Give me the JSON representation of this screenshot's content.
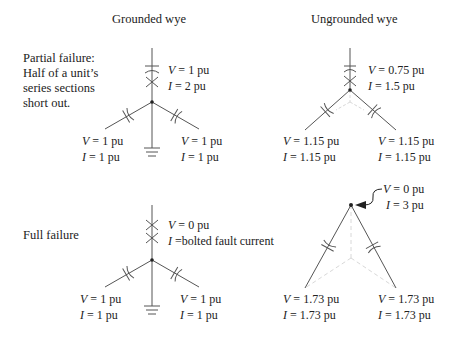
{
  "columns": {
    "left": "Grounded wye",
    "right": "Ungrounded wye"
  },
  "rows": {
    "partial": {
      "label_lines": [
        "Partial failure:",
        "Half of a unit’s",
        "series sections",
        "short out."
      ],
      "grounded": {
        "top": {
          "V": "1 pu",
          "I": "2 pu"
        },
        "left": {
          "V": "1 pu",
          "I": "1 pu"
        },
        "right": {
          "V": "1 pu",
          "I": "1 pu"
        }
      },
      "ungrounded": {
        "top": {
          "V": "0.75 pu",
          "I": "1.5 pu"
        },
        "left": {
          "V": "1.15 pu",
          "I": "1.15 pu"
        },
        "right": {
          "V": "1.15 pu",
          "I": "1.15 pu"
        }
      }
    },
    "full": {
      "label_lines": [
        "Full failure"
      ],
      "grounded": {
        "top": {
          "V": "0 pu",
          "I": "bolted fault current"
        },
        "left": {
          "V": "1 pu",
          "I": "1 pu"
        },
        "right": {
          "V": "1 pu",
          "I": "1 pu"
        }
      },
      "ungrounded": {
        "apex": {
          "V": "0 pu",
          "I": "3 pu"
        },
        "left": {
          "V": "1.73 pu",
          "I": "1.73 pu"
        },
        "right": {
          "V": "1.73 pu",
          "I": "1.73 pu"
        }
      }
    }
  },
  "symbols": {
    "V": "V",
    "I": "I",
    "eq": " = ",
    "eq_tight": " ="
  },
  "colors": {
    "line": "#555555",
    "faded": "#d8d8d8",
    "text": "#222222"
  }
}
